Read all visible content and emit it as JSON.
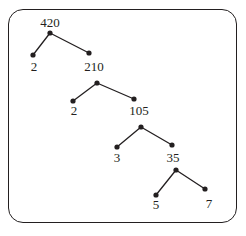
{
  "diagram": {
    "type": "factor-tree",
    "frame": {
      "shape": "rounded-rectangle",
      "x": 8,
      "y": 9,
      "width": 229,
      "height": 214,
      "radius": 15,
      "stroke_color": "#231f20",
      "stroke_width": 1.4
    },
    "style": {
      "dot_color": "#231f20",
      "dot_radius": 2.6,
      "edge_color": "#231f20",
      "edge_width": 1.3,
      "text_color": "#231f20",
      "font_size": 13
    },
    "nodes": [
      {
        "id": "n420",
        "value": "420",
        "dot_x": 50,
        "dot_y": 33,
        "label_x": 50,
        "label_y": 16,
        "label_pos": "above"
      },
      {
        "id": "n2a",
        "value": "2",
        "dot_x": 33,
        "dot_y": 55,
        "label_x": 34,
        "label_y": 60,
        "label_pos": "below"
      },
      {
        "id": "n210",
        "value": "210",
        "dot_x": 89,
        "dot_y": 53,
        "label_x": 94,
        "label_y": 60,
        "label_pos": "below"
      },
      {
        "id": "n210b",
        "value": "",
        "dot_x": 97,
        "dot_y": 83,
        "label_x": 97,
        "label_y": 83,
        "label_pos": "none"
      },
      {
        "id": "n2b",
        "value": "2",
        "dot_x": 73,
        "dot_y": 101,
        "label_x": 74,
        "label_y": 104,
        "label_pos": "below"
      },
      {
        "id": "n105",
        "value": "105",
        "dot_x": 134,
        "dot_y": 99,
        "label_x": 139,
        "label_y": 104,
        "label_pos": "below"
      },
      {
        "id": "n105b",
        "value": "",
        "dot_x": 141,
        "dot_y": 127,
        "label_x": 141,
        "label_y": 127,
        "label_pos": "none"
      },
      {
        "id": "n3",
        "value": "3",
        "dot_x": 117,
        "dot_y": 147,
        "label_x": 117,
        "label_y": 151,
        "label_pos": "below"
      },
      {
        "id": "n35",
        "value": "35",
        "dot_x": 172,
        "dot_y": 145,
        "label_x": 173,
        "label_y": 151,
        "label_pos": "below"
      },
      {
        "id": "n35b",
        "value": "",
        "dot_x": 176,
        "dot_y": 170,
        "label_x": 176,
        "label_y": 170,
        "label_pos": "none"
      },
      {
        "id": "n5",
        "value": "5",
        "dot_x": 156,
        "dot_y": 195,
        "label_x": 156,
        "label_y": 198,
        "label_pos": "below"
      },
      {
        "id": "n7",
        "value": "7",
        "dot_x": 205,
        "dot_y": 189,
        "label_x": 209,
        "label_y": 197,
        "label_pos": "below"
      }
    ],
    "edges": [
      {
        "from": "n420",
        "to": "n2a"
      },
      {
        "from": "n420",
        "to": "n210"
      },
      {
        "from": "n210b",
        "to": "n2b"
      },
      {
        "from": "n210b",
        "to": "n105"
      },
      {
        "from": "n105b",
        "to": "n3"
      },
      {
        "from": "n105b",
        "to": "n35"
      },
      {
        "from": "n35b",
        "to": "n5"
      },
      {
        "from": "n35b",
        "to": "n7"
      }
    ],
    "factorization": {
      "number": "420",
      "prime_factors": [
        "2",
        "2",
        "3",
        "5",
        "7"
      ]
    }
  }
}
